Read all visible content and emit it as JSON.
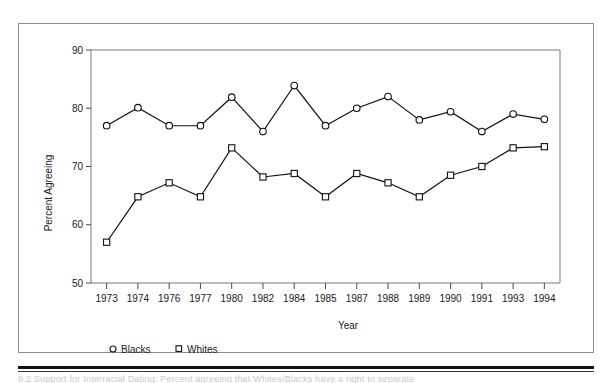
{
  "figure": {
    "background_color": "#ffffff",
    "frame_color": "#8b8b8b",
    "line_color": "#111111",
    "marker_fill": "#ffffff"
  },
  "caption": {
    "cut_off_text": "9.2 Support for Interracial Dating: Percent agreeing that Whites/Blacks have a right to separate"
  },
  "chart_data": {
    "type": "line",
    "title": "",
    "xlabel": "Year",
    "ylabel": "Percent Agreeing",
    "categories": [
      "1973",
      "1974",
      "1976",
      "1977",
      "1980",
      "1982",
      "1984",
      "1985",
      "1987",
      "1988",
      "1989",
      "1990",
      "1991",
      "1993",
      "1994"
    ],
    "ylim": [
      50,
      90
    ],
    "yticks": [
      50,
      60,
      70,
      80,
      90
    ],
    "ytick_labels": [
      "50",
      "60",
      "70",
      "80",
      "90"
    ],
    "grid": false,
    "legend_position": "below-left",
    "series": [
      {
        "name": "Blacks",
        "marker": "circle",
        "values": [
          77.0,
          80.1,
          77.0,
          77.0,
          81.9,
          76.0,
          83.9,
          77.0,
          80.0,
          82.0,
          78.0,
          79.4,
          76.0,
          79.0,
          78.1
        ]
      },
      {
        "name": "Whites",
        "marker": "square",
        "values": [
          57.0,
          64.8,
          67.2,
          64.8,
          73.2,
          68.2,
          68.8,
          64.8,
          68.8,
          67.2,
          64.8,
          68.5,
          70.0,
          73.2,
          73.4
        ]
      }
    ]
  }
}
